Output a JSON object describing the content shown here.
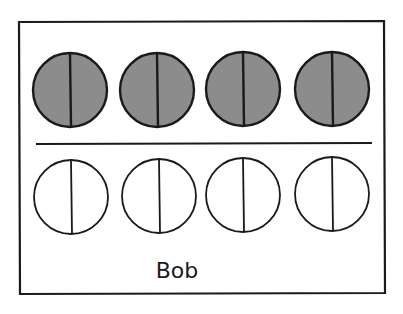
{
  "diagram": {
    "caption": "Bob",
    "colors": {
      "stroke": "#1a1a1a",
      "filled": "#8c8c8c",
      "empty": "#ffffff",
      "background": "#ffffff"
    },
    "frame": {
      "x1": 19,
      "y1": 22,
      "x2": 384,
      "y2": 294
    },
    "divider": {
      "x1": 36,
      "y1": 144,
      "x2": 372,
      "y2": 143
    },
    "top_row": {
      "fill": "filled",
      "circles": [
        {
          "cx": 70,
          "cy": 90,
          "r": 37
        },
        {
          "cx": 157,
          "cy": 90,
          "r": 37
        },
        {
          "cx": 243,
          "cy": 89,
          "r": 37
        },
        {
          "cx": 332,
          "cy": 89,
          "r": 37
        }
      ]
    },
    "bottom_row": {
      "fill": "empty",
      "circles": [
        {
          "cx": 71,
          "cy": 197,
          "r": 37
        },
        {
          "cx": 159,
          "cy": 196,
          "r": 37
        },
        {
          "cx": 243,
          "cy": 195,
          "r": 37
        },
        {
          "cx": 332,
          "cy": 194,
          "r": 37
        }
      ]
    }
  }
}
